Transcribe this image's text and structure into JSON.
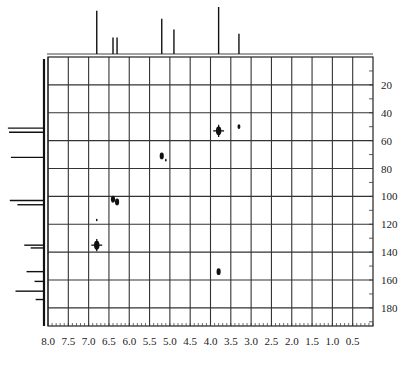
{
  "chart_data": {
    "type": "scatter",
    "title": "",
    "xlabel": "",
    "ylabel": "",
    "x_axis": {
      "reversed": true,
      "range": [
        8.0,
        0.0
      ],
      "ticks": [
        "8.0",
        "7.5",
        "7.0",
        "6.5",
        "6.0",
        "5.5",
        "5.0",
        "4.5",
        "4.0",
        "3.5",
        "3.0",
        "2.5",
        "2.0",
        "1.5",
        "1.0",
        "0.5"
      ]
    },
    "y_axis": {
      "reversed": true,
      "position": "right",
      "range": [
        0,
        193
      ],
      "ticks": [
        "20",
        "40",
        "60",
        "80",
        "100",
        "120",
        "140",
        "160",
        "180"
      ]
    },
    "grid": true,
    "legend": null,
    "cross_peaks": [
      {
        "x": 3.8,
        "y": 53,
        "size": "large"
      },
      {
        "x": 3.3,
        "y": 50,
        "size": "small"
      },
      {
        "x": 5.2,
        "y": 71,
        "size": "medium"
      },
      {
        "x": 5.1,
        "y": 74,
        "size": "tiny"
      },
      {
        "x": 6.4,
        "y": 102,
        "size": "medium"
      },
      {
        "x": 6.3,
        "y": 104,
        "size": "medium"
      },
      {
        "x": 6.8,
        "y": 117,
        "size": "tiny"
      },
      {
        "x": 6.8,
        "y": 135,
        "size": "large"
      },
      {
        "x": 3.8,
        "y": 154,
        "size": "medium"
      }
    ],
    "top_projection_peaks": [
      {
        "x": 6.8,
        "height": 0.92
      },
      {
        "x": 6.4,
        "height": 0.35
      },
      {
        "x": 6.3,
        "height": 0.35
      },
      {
        "x": 5.2,
        "height": 0.75
      },
      {
        "x": 4.9,
        "height": 0.52
      },
      {
        "x": 3.8,
        "height": 1.0
      },
      {
        "x": 3.3,
        "height": 0.43
      }
    ],
    "left_projection_peaks": [
      {
        "y": 51,
        "length": 0.95
      },
      {
        "y": 54,
        "length": 0.92
      },
      {
        "y": 72,
        "length": 0.87
      },
      {
        "y": 103,
        "length": 0.9
      },
      {
        "y": 106,
        "length": 0.7
      },
      {
        "y": 135,
        "length": 0.52
      },
      {
        "y": 137,
        "length": 0.35
      },
      {
        "y": 154,
        "length": 0.46
      },
      {
        "y": 161,
        "length": 0.25
      },
      {
        "y": 168,
        "length": 0.75
      },
      {
        "y": 174,
        "length": 0.22
      }
    ]
  },
  "caption": {
    "visible": true,
    "legible": false
  }
}
